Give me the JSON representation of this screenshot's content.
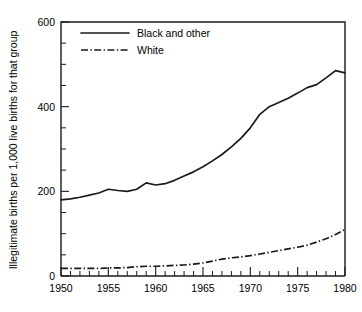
{
  "chart_data": {
    "type": "line",
    "title": "",
    "xlabel": "",
    "ylabel": "Illegitimate births per 1,000 live births for that group",
    "xlim": [
      1950,
      1980
    ],
    "ylim": [
      0,
      600
    ],
    "grid": false,
    "legend_position": "top-left-inside",
    "x_ticklabels": [
      "1950",
      "1955",
      "1960",
      "1965",
      "1970",
      "1975",
      "1980"
    ],
    "x_tickvalues": [
      1950,
      1955,
      1960,
      1965,
      1970,
      1975,
      1980
    ],
    "x_minor_step": 1,
    "y_ticklabels": [
      "0",
      "200",
      "400",
      "600"
    ],
    "y_tickvalues": [
      0,
      200,
      400,
      600
    ],
    "y_minor_step": 50,
    "x": [
      1950,
      1951,
      1952,
      1953,
      1954,
      1955,
      1956,
      1957,
      1958,
      1959,
      1960,
      1961,
      1962,
      1963,
      1964,
      1965,
      1966,
      1967,
      1968,
      1969,
      1970,
      1971,
      1972,
      1973,
      1974,
      1975,
      1976,
      1977,
      1978,
      1979,
      1980
    ],
    "series": [
      {
        "name": "Black and other",
        "style": "solid",
        "color": "#1a1a1a",
        "values": [
          180,
          182,
          186,
          191,
          196,
          205,
          202,
          200,
          205,
          220,
          215,
          218,
          226,
          236,
          246,
          258,
          272,
          287,
          305,
          325,
          350,
          382,
          400,
          410,
          420,
          432,
          445,
          452,
          468,
          485,
          480
        ]
      },
      {
        "name": "White",
        "style": "dash-dot",
        "color": "#1a1a1a",
        "values": [
          18,
          18,
          18,
          18,
          18,
          19,
          19,
          20,
          22,
          23,
          23,
          24,
          25,
          26,
          28,
          31,
          35,
          40,
          43,
          45,
          48,
          52,
          56,
          60,
          64,
          68,
          73,
          80,
          88,
          98,
          110
        ]
      }
    ]
  },
  "legend": {
    "entries": [
      {
        "label": "Black and other",
        "style": "solid"
      },
      {
        "label": "White",
        "style": "dash-dot"
      }
    ]
  }
}
